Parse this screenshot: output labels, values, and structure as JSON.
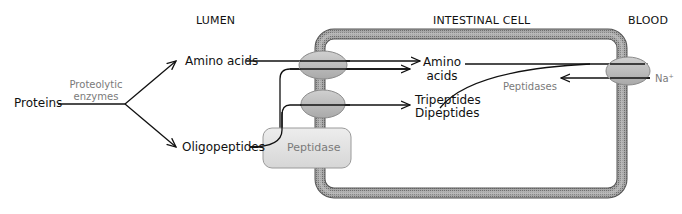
{
  "diagram": {
    "regions": {
      "lumen": "LUMEN",
      "intestinal_cell": "INTESTINAL CELL",
      "blood": "BLOOD"
    },
    "nodes": {
      "proteins": "Proteins",
      "amino_acids_lumen": "Amino acids",
      "oligopeptides": "Oligopeptides",
      "amino_acids_cell_line1": "Amino",
      "amino_acids_cell_line2": "acids",
      "tripeptides": "Tripeptides",
      "dipeptides": "Dipeptides",
      "peptidase_box": "Peptidase"
    },
    "annotations": {
      "proteolytic_line1": "Proteolytic",
      "proteolytic_line2": "enzymes",
      "peptidases": "Peptidases",
      "sodium": "Na⁺"
    },
    "colors": {
      "membrane": "#9a9a9a",
      "membrane_edge": "#555555",
      "transporter": "#b8b8b8",
      "peptidase_fill": "#e2e2e2",
      "arrow": "#111111",
      "annotation": "#7a7a7a"
    }
  }
}
